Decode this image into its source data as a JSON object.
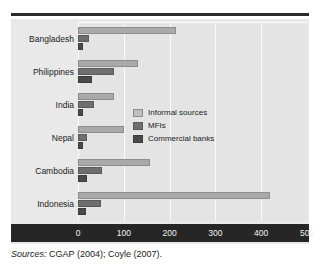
{
  "figure": {
    "source_note_prefix": "Sources:",
    "source_note_text": "CGAP (2004); Coyle (2007)."
  },
  "legend": {
    "position": "inside-right-middle",
    "entries": [
      {
        "label": "Informal sources",
        "color": "#bfbfbf",
        "swatch": "informal"
      },
      {
        "label": "MFIs",
        "color": "#6e6e6e",
        "swatch": "mfi"
      },
      {
        "label": "Commercial banks",
        "color": "#4a4a4a",
        "swatch": "bank"
      }
    ]
  },
  "chart_data": {
    "type": "bar",
    "orientation": "horizontal",
    "title": "",
    "xlabel": "",
    "ylabel": "",
    "xlim": [
      0,
      500
    ],
    "xticks": [
      0,
      100,
      200,
      300,
      400,
      500
    ],
    "grid": true,
    "grid_axis": "x",
    "legend_position": "center right",
    "categories": [
      "Bangladesh",
      "Philippines",
      "India",
      "Nepal",
      "Cambodia",
      "Indonesia"
    ],
    "series": [
      {
        "name": "Informal sources",
        "color": "#a9a9a9",
        "values": [
          215,
          130,
          78,
          100,
          157,
          420
        ]
      },
      {
        "name": "MFIs",
        "color": "#6e6e6e",
        "values": [
          25,
          78,
          35,
          20,
          52,
          50
        ]
      },
      {
        "name": "Commercial banks",
        "color": "#4a4a4a",
        "values": [
          12,
          30,
          12,
          12,
          20,
          18
        ]
      }
    ]
  },
  "colors": {
    "plot_background": "#e4e4e4",
    "panel_background": "#e9e9e9",
    "axis_band": "#262626",
    "gridline": "#fbfbfb",
    "rule": "#2b2b2b"
  }
}
